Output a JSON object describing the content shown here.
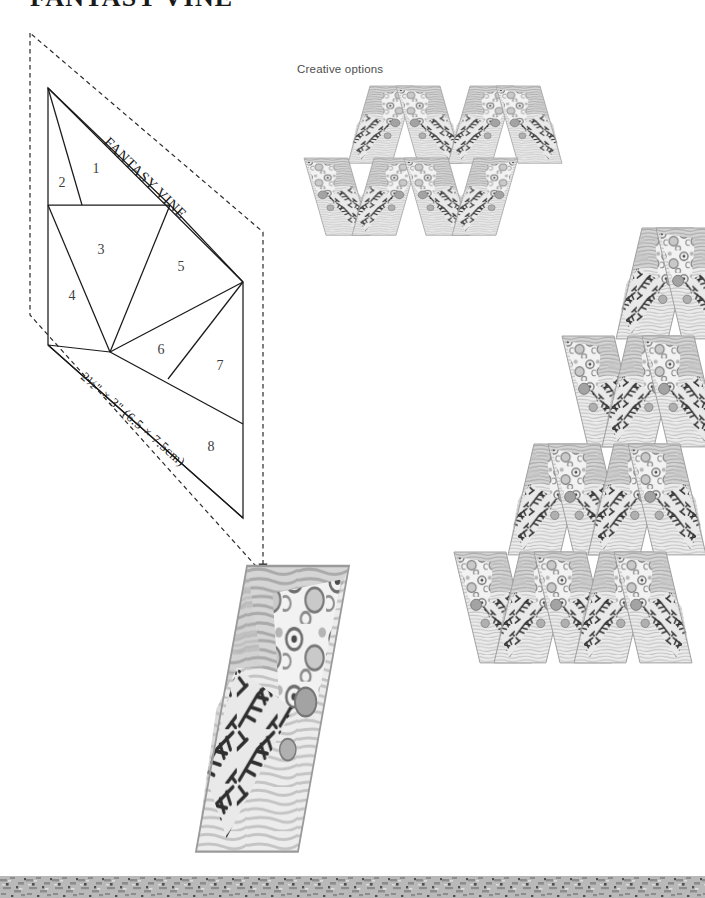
{
  "page": {
    "title": "FANTASY VINE",
    "width": 705,
    "height": 898,
    "background": "#ffffff",
    "ink": "#1a1a1a"
  },
  "diagram": {
    "name": "foundation-piecing-diagram",
    "vine_label": "FANTASY VINE",
    "size_label": "2½\" × 3\" (6.5 × 7.5cm)",
    "piece_numbers": [
      "1",
      "2",
      "3",
      "4",
      "5",
      "6",
      "7",
      "8"
    ],
    "pieces": [
      {
        "number": "1",
        "x": 96,
        "y": 170
      },
      {
        "number": "2",
        "x": 62,
        "y": 184
      },
      {
        "number": "3",
        "x": 101,
        "y": 251
      },
      {
        "number": "4",
        "x": 72,
        "y": 297
      },
      {
        "number": "5",
        "x": 181,
        "y": 268
      },
      {
        "number": "6",
        "x": 161,
        "y": 351
      },
      {
        "number": "7",
        "x": 220,
        "y": 367
      },
      {
        "number": "8",
        "x": 211,
        "y": 448
      }
    ],
    "seam_allowance_note": "dashed outline indicates seam allowance"
  },
  "creative_options": {
    "caption": "Creative options",
    "layouts": [
      {
        "name": "zigzag-band-layout",
        "blocks": 8,
        "orientation": "horizontal-band"
      },
      {
        "name": "large-diamond-layout",
        "blocks": 12,
        "orientation": "parallelogram"
      },
      {
        "name": "single-block-layout",
        "blocks": 1,
        "orientation": "single"
      }
    ]
  },
  "fabrics": {
    "palette": [
      {
        "name": "circle-dot-print",
        "tone": "#d8d8d8",
        "ink": "#5a5a5a"
      },
      {
        "name": "branch-fern-print",
        "tone": "#8a8a8a",
        "ink": "#2d2d2d"
      },
      {
        "name": "woodgrain-light",
        "tone": "#e3e3e3",
        "ink": "#a8a8a8"
      },
      {
        "name": "woodgrain-mid",
        "tone": "#cfcfcf",
        "ink": "#9a9a9a"
      }
    ]
  },
  "border": {
    "name": "mottled-gray-strip",
    "color": "#9c9c9c"
  }
}
